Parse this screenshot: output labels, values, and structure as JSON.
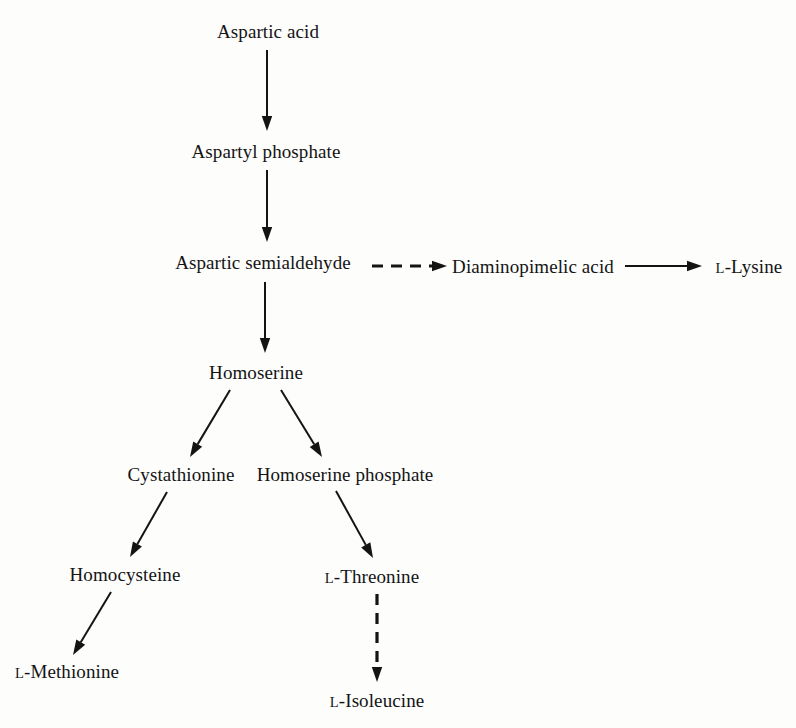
{
  "diagram": {
    "type": "flow-diagram",
    "background_color": "#fdfdfc",
    "stroke_color": "#141414",
    "nodes": [
      {
        "id": "aspartic_acid",
        "label": "Aspartic acid",
        "prefix": "",
        "x": 268,
        "y": 31
      },
      {
        "id": "aspartyl_phosphate",
        "label": "Aspartyl phosphate",
        "prefix": "",
        "x": 266,
        "y": 151
      },
      {
        "id": "aspartic_semialdehyde",
        "label": "Aspartic semialdehyde",
        "prefix": "",
        "x": 263,
        "y": 262
      },
      {
        "id": "diaminopimelic_acid",
        "label": "Diaminopimelic acid",
        "prefix": "",
        "x": 533,
        "y": 266
      },
      {
        "id": "l_lysine",
        "label": "-Lysine",
        "prefix": "L",
        "x": 749,
        "y": 266
      },
      {
        "id": "homoserine",
        "label": "Homoserine",
        "prefix": "",
        "x": 256,
        "y": 372
      },
      {
        "id": "cystathionine",
        "label": "Cystathionine",
        "prefix": "",
        "x": 181,
        "y": 474
      },
      {
        "id": "homoserine_phosphate",
        "label": "Homoserine phosphate",
        "prefix": "",
        "x": 345,
        "y": 474
      },
      {
        "id": "homocysteine",
        "label": "Homocysteine",
        "prefix": "",
        "x": 125,
        "y": 574
      },
      {
        "id": "l_threonine",
        "label": "-Threonine",
        "prefix": "L",
        "x": 372,
        "y": 576
      },
      {
        "id": "l_methionine",
        "label": "-Methionine",
        "prefix": "L",
        "x": 67,
        "y": 671
      },
      {
        "id": "l_isoleucine",
        "label": "-Isoleucine",
        "prefix": "L",
        "x": 377,
        "y": 700
      }
    ],
    "edges": [
      {
        "id": "e1",
        "from": "aspartic_acid",
        "to": "aspartyl_phosphate",
        "style": "solid",
        "x1": 267,
        "y1": 50,
        "x2": 267,
        "y2": 131
      },
      {
        "id": "e2",
        "from": "aspartyl_phosphate",
        "to": "aspartic_semialdehyde",
        "style": "solid",
        "x1": 267,
        "y1": 170,
        "x2": 267,
        "y2": 242
      },
      {
        "id": "e3",
        "from": "aspartic_semialdehyde",
        "to": "diaminopimelic_acid",
        "style": "dashed",
        "x1": 372,
        "y1": 266,
        "x2": 447,
        "y2": 266
      },
      {
        "id": "e4",
        "from": "diaminopimelic_acid",
        "to": "l_lysine",
        "style": "solid",
        "x1": 625,
        "y1": 266,
        "x2": 702,
        "y2": 266
      },
      {
        "id": "e5",
        "from": "aspartic_semialdehyde",
        "to": "homoserine",
        "style": "solid",
        "x1": 265,
        "y1": 282,
        "x2": 265,
        "y2": 353
      },
      {
        "id": "e6",
        "from": "homoserine",
        "to": "cystathionine",
        "style": "solid",
        "x1": 230,
        "y1": 390,
        "x2": 190,
        "y2": 457
      },
      {
        "id": "e7",
        "from": "homoserine",
        "to": "homoserine_phosphate",
        "style": "solid",
        "x1": 281,
        "y1": 390,
        "x2": 322,
        "y2": 457
      },
      {
        "id": "e8",
        "from": "cystathionine",
        "to": "homocysteine",
        "style": "solid",
        "x1": 167,
        "y1": 492,
        "x2": 130,
        "y2": 557
      },
      {
        "id": "e9",
        "from": "homoserine_phosphate",
        "to": "l_threonine",
        "style": "solid",
        "x1": 336,
        "y1": 491,
        "x2": 373,
        "y2": 558
      },
      {
        "id": "e10",
        "from": "homocysteine",
        "to": "l_methionine",
        "style": "solid",
        "x1": 111,
        "y1": 592,
        "x2": 73,
        "y2": 655
      },
      {
        "id": "e11",
        "from": "l_threonine",
        "to": "l_isoleucine",
        "style": "dashed",
        "x1": 377,
        "y1": 594,
        "x2": 377,
        "y2": 682
      }
    ]
  }
}
